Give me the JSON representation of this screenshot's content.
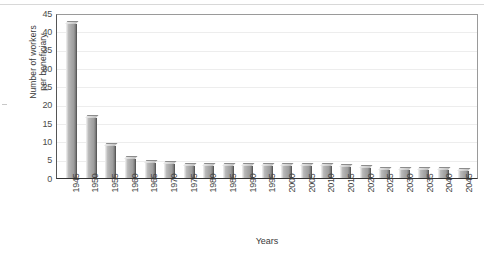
{
  "chart_data": {
    "type": "bar",
    "title": "",
    "xlabel": "Years",
    "ylabel": "Number of workers per beneficiary",
    "ylabel_lines": [
      "Number of workers",
      "per beneficiary"
    ],
    "ylim": [
      0,
      45
    ],
    "ytick_step": 5,
    "yticks": [
      45,
      40,
      35,
      30,
      25,
      20,
      15,
      10,
      5,
      0
    ],
    "grid": true,
    "grid_axis": "y",
    "legend": null,
    "legend_position": "none",
    "bar_style": "3d-grayscale",
    "categories": [
      "1945",
      "1950",
      "1955",
      "1960",
      "1965",
      "1970",
      "1975",
      "1980",
      "1985",
      "1990",
      "1995",
      "2000",
      "2005",
      "2010",
      "2015",
      "2020",
      "2025",
      "2030",
      "2035",
      "2040",
      "2045"
    ],
    "values": [
      41.9,
      16.5,
      8.6,
      5.1,
      4.0,
      3.7,
      3.4,
      3.3,
      3.3,
      3.4,
      3.3,
      3.4,
      3.3,
      3.3,
      3.0,
      2.6,
      2.3,
      2.2,
      2.1,
      2.1,
      2.0
    ]
  },
  "colors": {
    "bar_light": "#e2e2e2",
    "bar_face": "#a8a8a8",
    "bar_shadow": "#6f6f6f",
    "gridline": "#ededed",
    "axis": "#333333",
    "text": "#3d3d3d"
  }
}
